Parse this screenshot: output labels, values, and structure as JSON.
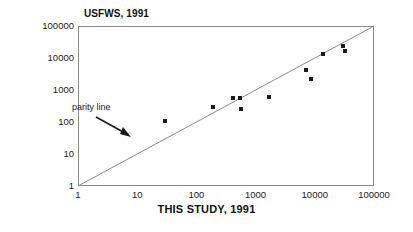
{
  "chart_data": {
    "type": "scatter",
    "title": "USFWS, 1991",
    "xlabel": "THIS STUDY, 1991",
    "ylabel": "USFWS, 1991",
    "xscale": "log",
    "yscale": "log",
    "xlim": [
      1,
      100000
    ],
    "ylim": [
      1,
      100000
    ],
    "grid": false,
    "legend": "none",
    "xticks": [
      "1",
      "10",
      "100",
      "1000",
      "10000",
      "100000"
    ],
    "xtick_values": [
      1,
      10,
      100,
      1000,
      10000,
      100000
    ],
    "yticks": [
      "1",
      "10",
      "100",
      "1000",
      "10000",
      "100000"
    ],
    "ytick_values": [
      1,
      10,
      100,
      1000,
      10000,
      100000
    ],
    "series": [
      {
        "name": "survey comparison",
        "marker": "square",
        "color": "#1b1b1b",
        "points": [
          {
            "x": 30,
            "y": 110
          },
          {
            "x": 190,
            "y": 290
          },
          {
            "x": 420,
            "y": 560
          },
          {
            "x": 540,
            "y": 560
          },
          {
            "x": 560,
            "y": 250
          },
          {
            "x": 1700,
            "y": 620
          },
          {
            "x": 7000,
            "y": 4200
          },
          {
            "x": 8500,
            "y": 2200
          },
          {
            "x": 14000,
            "y": 13000
          },
          {
            "x": 30000,
            "y": 24000
          },
          {
            "x": 32000,
            "y": 16000
          }
        ]
      }
    ],
    "reference_line": {
      "name": "parity line",
      "description": "y = x (1:1 line)",
      "from": {
        "x": 1,
        "y": 1
      },
      "to": {
        "x": 100000,
        "y": 100000
      },
      "color": "#8a8a8a"
    },
    "annotations": [
      {
        "text": "parity line",
        "at": {
          "x": 11,
          "y": 400
        },
        "arrow_to": {
          "x": 70,
          "y": 38
        }
      }
    ]
  },
  "figure": {
    "title": "USFWS, 1991",
    "xaxis_title": "THIS STUDY, 1991",
    "annotation_label": "parity line"
  }
}
